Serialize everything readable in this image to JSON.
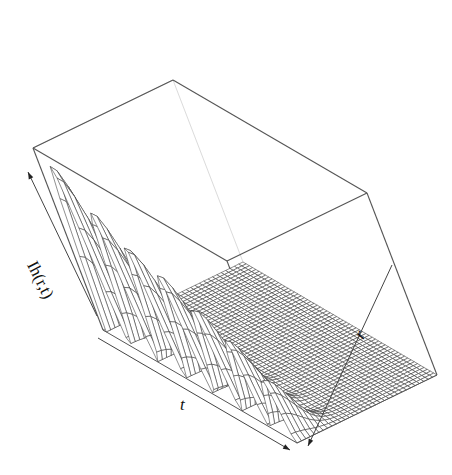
{
  "chart_data": {
    "type": "surface3d",
    "title": "",
    "xlabel": "t",
    "ylabel": "r",
    "zlabel": "Ih(r,t)",
    "grid": false,
    "legend": null,
    "render_style": "wireframe perspective (persp)",
    "box": true,
    "tick_labels": false,
    "surface_description": "Sequence of ~7 oscillating peaks along t, concentrated at small r; peak height grows with t; surface decays toward zero for larger r forming a flat mesh",
    "peaks": [
      {
        "index": 1,
        "relative_height": 0.32
      },
      {
        "index": 2,
        "relative_height": 0.45
      },
      {
        "index": 3,
        "relative_height": 0.55
      },
      {
        "index": 4,
        "relative_height": 0.64
      },
      {
        "index": 5,
        "relative_height": 0.72
      },
      {
        "index": 6,
        "relative_height": 0.82
      },
      {
        "index": 7,
        "relative_height": 1.0
      }
    ],
    "mesh": {
      "t_lines": 60,
      "r_lines": 32
    },
    "colors": {
      "line": "#333333",
      "box": "#555555",
      "background": "#ffffff"
    }
  },
  "labels": {
    "z": "Ih(r,t)",
    "x": "t",
    "y": "r"
  }
}
